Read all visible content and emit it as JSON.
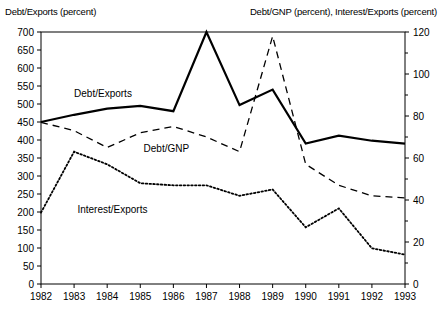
{
  "chart_data": {
    "type": "line",
    "title": "",
    "xlabel": "",
    "ylabel": "Debt/Exports (percent)",
    "y2label": "Debt/GNP (percent), Interest/Exports (percent)",
    "categories": [
      "1982",
      "1983",
      "1984",
      "1985",
      "1986",
      "1987",
      "1988",
      "1989",
      "1990",
      "1991",
      "1992",
      "1993"
    ],
    "x": [
      1982,
      1983,
      1984,
      1985,
      1986,
      1987,
      1988,
      1989,
      1990,
      1991,
      1992,
      1993
    ],
    "ylim": [
      0,
      700
    ],
    "yticks": [
      0,
      50,
      100,
      150,
      200,
      250,
      300,
      350,
      400,
      450,
      500,
      550,
      600,
      650,
      700
    ],
    "y2lim": [
      0,
      120
    ],
    "y2ticks": [
      0,
      20,
      40,
      60,
      80,
      100,
      120
    ],
    "y2_minor_ticks": [
      10,
      30,
      50,
      70,
      90,
      110
    ],
    "grid": false,
    "legend": "inline-labels",
    "series": [
      {
        "name": "Debt/Exports",
        "axis": "left",
        "style": "solid",
        "label_x": 1983.0,
        "label_y": 520,
        "values": [
          450,
          470,
          487,
          495,
          480,
          700,
          497,
          540,
          390,
          412,
          398,
          390
        ]
      },
      {
        "name": "Debt/GNP",
        "axis": "right",
        "style": "dashed",
        "label_x": 1985.1,
        "label_y": 63,
        "values": [
          77,
          73,
          65,
          72,
          75,
          70,
          63,
          118,
          57,
          47,
          42,
          41
        ]
      },
      {
        "name": "Interest/Exports",
        "axis": "right",
        "style": "dotted",
        "label_x": 1983.1,
        "label_y": 34,
        "values": [
          34,
          63,
          57,
          48,
          47,
          47,
          42,
          45,
          27,
          36,
          17,
          14
        ]
      }
    ],
    "series_values_left_axis": {
      "Debt/GNP": [
        450,
        425,
        380,
        420,
        437,
        410,
        368,
        690,
        333,
        275,
        245,
        240
      ],
      "Interest/Exports": [
        198,
        368,
        332,
        282,
        276,
        277,
        246,
        263,
        155,
        210,
        98,
        80
      ]
    }
  },
  "axis_titles": {
    "left": "Debt/Exports (percent)",
    "right": "Debt/GNP (percent), Interest/Exports (percent)"
  }
}
